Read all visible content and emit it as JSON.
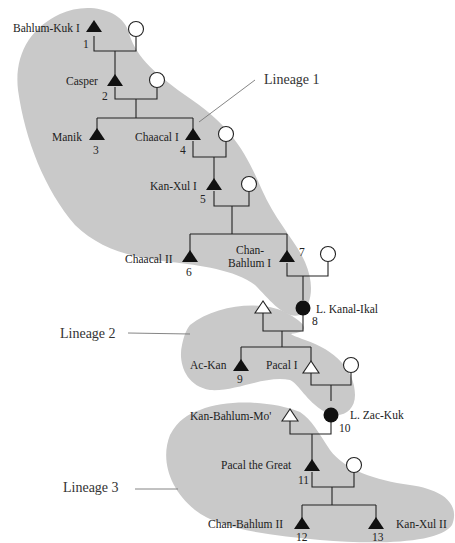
{
  "diagram": {
    "type": "genealogy",
    "lineages": [
      {
        "label": "Lineage 1"
      },
      {
        "label": "Lineage 2"
      },
      {
        "label": "Lineage 3"
      }
    ],
    "people": [
      {
        "id": 1,
        "name": "Bahlum-Kuk I",
        "number": "1",
        "symbol": "filled-triangle"
      },
      {
        "id": 2,
        "name": "Casper",
        "number": "2",
        "symbol": "filled-triangle"
      },
      {
        "id": 3,
        "name": "Manik",
        "number": "3",
        "symbol": "filled-triangle"
      },
      {
        "id": 4,
        "name": "Chaacal I",
        "number": "4",
        "symbol": "filled-triangle"
      },
      {
        "id": 5,
        "name": "Kan-Xul I",
        "number": "5",
        "symbol": "filled-triangle"
      },
      {
        "id": 6,
        "name": "Chaacal II",
        "number": "6",
        "symbol": "filled-triangle"
      },
      {
        "id": 7,
        "name_line1": "Chan-",
        "name_line2": "Bahlum I",
        "number": "7",
        "symbol": "filled-triangle"
      },
      {
        "id": 8,
        "name": "L. Kanal-Ikal",
        "number": "8",
        "symbol": "filled-circle"
      },
      {
        "id": 9,
        "name": "Ac-Kan",
        "number": "9",
        "symbol": "filled-triangle"
      },
      {
        "id": 10,
        "name": "L. Zac-Kuk",
        "number": "10",
        "symbol": "filled-circle"
      },
      {
        "id": 11,
        "name": "Pacal the Great",
        "number": "11",
        "symbol": "filled-triangle"
      },
      {
        "id": 12,
        "name": "Chan-Bahlum II",
        "number": "12",
        "symbol": "filled-triangle"
      },
      {
        "id": 13,
        "name": "Kan-Xul II",
        "number": "13",
        "symbol": "filled-triangle"
      },
      {
        "id": "p1",
        "name": "Pacal I",
        "symbol": "open-triangle"
      },
      {
        "id": "kbm",
        "name": "Kan-Bahlum-Mo'",
        "symbol": "open-triangle"
      }
    ],
    "colors": {
      "region": "#c9c9c9",
      "line": "#222222",
      "background": "#ffffff"
    }
  }
}
